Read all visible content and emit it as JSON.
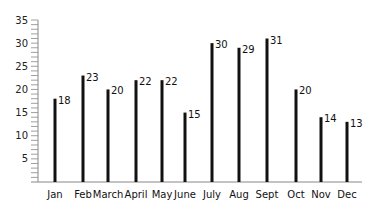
{
  "chart_data": {
    "type": "bar",
    "title": "",
    "xlabel": "",
    "ylabel": "",
    "ylim": [
      0,
      35
    ],
    "yticks": [
      5,
      10,
      15,
      20,
      25,
      30,
      35
    ],
    "minor_tick_step": 1,
    "grid": false,
    "legend": null,
    "categories": [
      "Jan",
      "Feb",
      "March",
      "April",
      "May",
      "June",
      "July",
      "Aug",
      "Sept",
      "Oct",
      "Nov",
      "Dec"
    ],
    "values": [
      18,
      23,
      20,
      22,
      22,
      15,
      30,
      29,
      31,
      20,
      14,
      13
    ],
    "bar_x": [
      55,
      83,
      108,
      136,
      162,
      185,
      212,
      239,
      267,
      296,
      321,
      347
    ],
    "style": {
      "bar_color": "#111111",
      "axis_color": "#888888",
      "bar_width": 3
    }
  }
}
